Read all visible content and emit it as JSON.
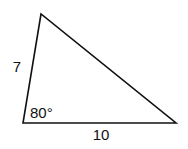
{
  "diagram": {
    "type": "triangle",
    "vertices": {
      "top": [
        41,
        14
      ],
      "bottom_left": [
        23,
        123
      ],
      "bottom_right": [
        176,
        123
      ]
    },
    "labels": {
      "left_side": "7",
      "bottom_side": "10",
      "angle": "80°"
    },
    "colors": {
      "stroke": "#111111",
      "background": "#ffffff"
    }
  }
}
